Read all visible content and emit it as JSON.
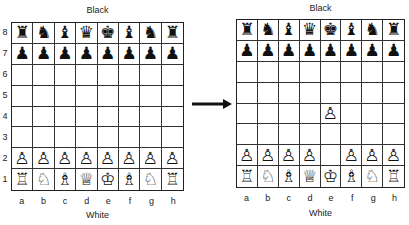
{
  "boards": [
    {
      "id": "before",
      "top_label": "Black",
      "bottom_label": "White",
      "files": [
        "a",
        "b",
        "c",
        "d",
        "e",
        "f",
        "g",
        "h"
      ],
      "ranks": [
        "8",
        "7",
        "6",
        "5",
        "4",
        "3",
        "2",
        "1"
      ],
      "position": [
        [
          "bR",
          "bN",
          "bB",
          "bQ",
          "bK",
          "bB",
          "bN",
          "bR"
        ],
        [
          "bP",
          "bP",
          "bP",
          "bP",
          "bP",
          "bP",
          "bP",
          "bP"
        ],
        [
          "",
          "",
          "",
          "",
          "",
          "",
          "",
          ""
        ],
        [
          "",
          "",
          "",
          "",
          "",
          "",
          "",
          ""
        ],
        [
          "",
          "",
          "",
          "",
          "",
          "",
          "",
          ""
        ],
        [
          "",
          "",
          "",
          "",
          "",
          "",
          "",
          ""
        ],
        [
          "wP",
          "wP",
          "wP",
          "wP",
          "wP",
          "wP",
          "wP",
          "wP"
        ],
        [
          "wR",
          "wN",
          "wB",
          "wQ",
          "wK",
          "wB",
          "wN",
          "wR"
        ]
      ]
    },
    {
      "id": "after",
      "top_label": "Black",
      "bottom_label": "White",
      "files": [
        "a",
        "b",
        "c",
        "d",
        "e",
        "f",
        "g",
        "h"
      ],
      "ranks": [
        "8",
        "7",
        "6",
        "5",
        "4",
        "3",
        "2",
        "1"
      ],
      "position": [
        [
          "bR",
          "bN",
          "bB",
          "bQ",
          "bK",
          "bB",
          "bN",
          "bR"
        ],
        [
          "bP",
          "bP",
          "bP",
          "bP",
          "bP",
          "bP",
          "bP",
          "bP"
        ],
        [
          "",
          "",
          "",
          "",
          "",
          "",
          "",
          ""
        ],
        [
          "",
          "",
          "",
          "",
          "",
          "",
          "",
          ""
        ],
        [
          "",
          "",
          "",
          "",
          "wP",
          "",
          "",
          ""
        ],
        [
          "",
          "",
          "",
          "",
          "",
          "",
          "",
          ""
        ],
        [
          "wP",
          "wP",
          "wP",
          "wP",
          "",
          "wP",
          "wP",
          "wP"
        ],
        [
          "wR",
          "wN",
          "wB",
          "wQ",
          "wK",
          "wB",
          "wN",
          "wR"
        ]
      ]
    }
  ],
  "move": {
    "from": "e2",
    "to": "e4",
    "arrow": "right-arrow"
  },
  "glyphs": {
    "bK": "♚",
    "bQ": "♛",
    "bR": "♜",
    "bB": "♝",
    "bN": "♞",
    "bP": "♟",
    "wK": "♔",
    "wQ": "♕",
    "wR": "♖",
    "wB": "♗",
    "wN": "♘",
    "wP": "♙"
  },
  "piece_names": {
    "K": "king",
    "Q": "queen",
    "R": "rook",
    "B": "bishop",
    "N": "knight",
    "P": "pawn"
  }
}
